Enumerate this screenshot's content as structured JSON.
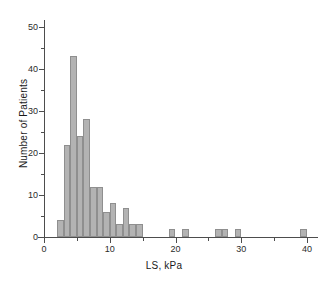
{
  "chart_data": {
    "type": "bar",
    "title": "",
    "subtitle": "",
    "xlabel": "LS, kPa",
    "ylabel": "Number of Patients",
    "xlim": [
      0,
      42
    ],
    "ylim": [
      0,
      53
    ],
    "grid": false,
    "legend": null,
    "bin_width": 1,
    "x_ticks": [
      {
        "value": 0,
        "label": "0",
        "type": "major"
      },
      {
        "value": 5,
        "label": "",
        "type": "minor"
      },
      {
        "value": 10,
        "label": "10",
        "type": "major"
      },
      {
        "value": 15,
        "label": "",
        "type": "minor"
      },
      {
        "value": 20,
        "label": "20",
        "type": "major"
      },
      {
        "value": 25,
        "label": "",
        "type": "minor"
      },
      {
        "value": 30,
        "label": "30",
        "type": "major"
      },
      {
        "value": 35,
        "label": "",
        "type": "minor"
      },
      {
        "value": 40,
        "label": "40",
        "type": "major"
      }
    ],
    "y_ticks": [
      {
        "value": 0,
        "label": "0",
        "type": "major"
      },
      {
        "value": 5,
        "label": "",
        "type": "minor"
      },
      {
        "value": 10,
        "label": "10",
        "type": "major"
      },
      {
        "value": 15,
        "label": "",
        "type": "minor"
      },
      {
        "value": 20,
        "label": "20",
        "type": "major"
      },
      {
        "value": 25,
        "label": "",
        "type": "minor"
      },
      {
        "value": 30,
        "label": "30",
        "type": "major"
      },
      {
        "value": 35,
        "label": "",
        "type": "minor"
      },
      {
        "value": 40,
        "label": "40",
        "type": "major"
      },
      {
        "value": 45,
        "label": "",
        "type": "minor"
      },
      {
        "value": 50,
        "label": "50",
        "type": "major"
      }
    ],
    "bin_starts": [
      2,
      3,
      4,
      5,
      6,
      7,
      8,
      9,
      10,
      11,
      12,
      13,
      14,
      19,
      21,
      26,
      27,
      29,
      39
    ],
    "values": [
      4,
      22,
      43,
      24,
      28,
      12,
      12,
      6,
      8,
      3,
      7,
      3,
      3,
      2,
      2,
      2,
      2,
      2,
      2
    ],
    "bars": [
      {
        "x0": 2,
        "x1": 3,
        "value": 4
      },
      {
        "x0": 3,
        "x1": 4,
        "value": 22
      },
      {
        "x0": 4,
        "x1": 5,
        "value": 43
      },
      {
        "x0": 5,
        "x1": 6,
        "value": 24
      },
      {
        "x0": 6,
        "x1": 7,
        "value": 28
      },
      {
        "x0": 7,
        "x1": 8,
        "value": 12
      },
      {
        "x0": 8,
        "x1": 9,
        "value": 12
      },
      {
        "x0": 9,
        "x1": 10,
        "value": 6
      },
      {
        "x0": 10,
        "x1": 11,
        "value": 8
      },
      {
        "x0": 11,
        "x1": 12,
        "value": 3
      },
      {
        "x0": 12,
        "x1": 13,
        "value": 7
      },
      {
        "x0": 13,
        "x1": 14,
        "value": 3
      },
      {
        "x0": 14,
        "x1": 15,
        "value": 3
      },
      {
        "x0": 19,
        "x1": 20,
        "value": 2
      },
      {
        "x0": 21,
        "x1": 22,
        "value": 2
      },
      {
        "x0": 26,
        "x1": 27,
        "value": 2
      },
      {
        "x0": 27,
        "x1": 28,
        "value": 2
      },
      {
        "x0": 29,
        "x1": 30,
        "value": 2
      },
      {
        "x0": 39,
        "x1": 40,
        "value": 2
      }
    ],
    "colors": {
      "bar_fill": "#b3b3b3",
      "bar_edge": "#8f8f8f",
      "axis": "#4d4d4d",
      "text": "#1a1a1a",
      "background": "#ffffff"
    }
  }
}
